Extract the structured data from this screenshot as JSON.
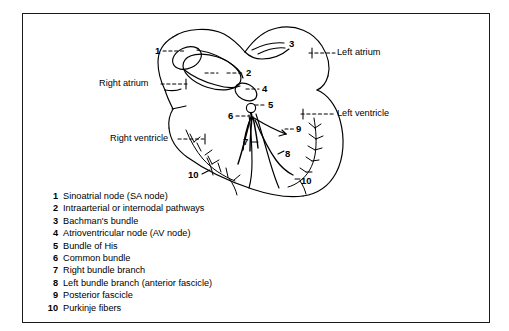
{
  "figure": {
    "border_color": "#1a1a1a",
    "background": "#ffffff",
    "stroke_color": "#000000"
  },
  "anatomy_labels": [
    {
      "name": "left-atrium",
      "text": "Left atrium",
      "x": 337,
      "y": 53,
      "align": "left"
    },
    {
      "name": "right-atrium",
      "text": "Right atrium",
      "x": 99,
      "y": 84,
      "align": "left"
    },
    {
      "name": "left-ventricle",
      "text": "Left ventricle",
      "x": 337,
      "y": 114,
      "align": "left"
    },
    {
      "name": "right-ventricle",
      "text": "Right ventricle",
      "x": 110,
      "y": 139,
      "align": "left"
    }
  ],
  "callout_numbers": [
    {
      "name": "callout-1",
      "text": "1",
      "x": 155,
      "y": 51
    },
    {
      "name": "callout-2",
      "text": "2",
      "x": 246,
      "y": 73
    },
    {
      "name": "callout-3",
      "text": "3",
      "x": 289,
      "y": 44
    },
    {
      "name": "callout-4",
      "text": "4",
      "x": 262,
      "y": 89
    },
    {
      "name": "callout-5",
      "text": "5",
      "x": 268,
      "y": 105
    },
    {
      "name": "callout-6",
      "text": "6",
      "x": 228,
      "y": 116
    },
    {
      "name": "callout-7",
      "text": "7",
      "x": 243,
      "y": 144
    },
    {
      "name": "callout-8",
      "text": "8",
      "x": 285,
      "y": 156
    },
    {
      "name": "callout-9",
      "text": "9",
      "x": 296,
      "y": 131
    },
    {
      "name": "callout-10a",
      "text": "10",
      "x": 188,
      "y": 175
    },
    {
      "name": "callout-10b",
      "text": "10",
      "x": 301,
      "y": 181
    }
  ],
  "legend": {
    "items": [
      {
        "num": "1",
        "label": "Sinoatrial node (SA node)"
      },
      {
        "num": "2",
        "label": "Intraarterial or internodal pathways"
      },
      {
        "num": "3",
        "label": "Bachman's bundle"
      },
      {
        "num": "4",
        "label": "Atrioventricular node (AV node)"
      },
      {
        "num": "5",
        "label": "Bundle of His"
      },
      {
        "num": "6",
        "label": "Common bundle"
      },
      {
        "num": "7",
        "label": "Right bundle branch"
      },
      {
        "num": "8",
        "label": "Left bundle branch (anterior fascicle)"
      },
      {
        "num": "9",
        "label": "Posterior fascicle"
      },
      {
        "num": "10",
        "label": "Purkinje fibers"
      }
    ]
  }
}
